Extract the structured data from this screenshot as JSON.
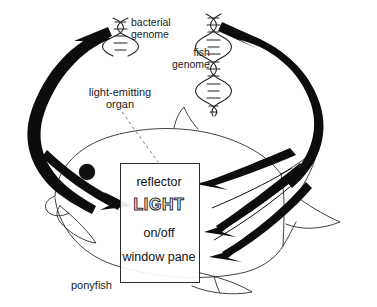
{
  "diagram": {
    "background_color": "#ffffff",
    "ink_color": "#111111"
  },
  "labels": {
    "bacterial_genome": "bacterial\ngenome",
    "fish_genome": "fish\ngenome",
    "light_emitting_organ": "light-emitting\norgan",
    "ponyfish": "ponyfish"
  },
  "organ_box": {
    "components": [
      {
        "id": "reflector",
        "label": "reflector"
      },
      {
        "id": "light",
        "label": "LIGHT"
      },
      {
        "id": "onoff",
        "label": "on/off"
      },
      {
        "id": "window_pane",
        "label": "window\npane"
      }
    ]
  },
  "icons": {
    "bacterial_helix": "dna-helix-icon",
    "fish_helix": "dna-helix-icon",
    "fish_eye": "fish-eye-icon"
  }
}
